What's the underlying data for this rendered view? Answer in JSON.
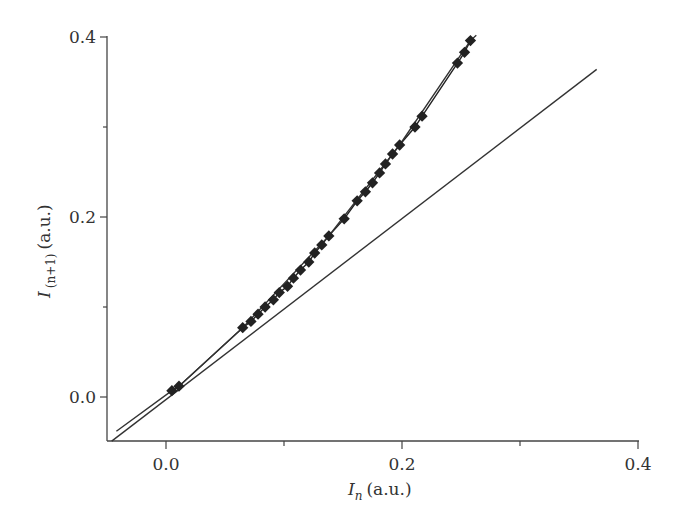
{
  "chart_data": {
    "type": "scatter",
    "title": "",
    "xlabel": "I_n (a.u.)",
    "ylabel": "I_(n+1) (a.u.)",
    "xlabel_parts": {
      "symbol": "I",
      "subscript": "n",
      "unit": "(a.u.)"
    },
    "ylabel_parts": {
      "symbol": "I",
      "subscript": "(n+1)",
      "unit": "(a.u.)"
    },
    "xlim": [
      -0.05,
      0.4
    ],
    "ylim": [
      -0.05,
      0.4
    ],
    "x_ticks": [
      0.0,
      0.1,
      0.2,
      0.3,
      0.4
    ],
    "x_tick_labels": [
      "0.0",
      "",
      "0.2",
      "",
      "0.4"
    ],
    "y_ticks": [
      0.0,
      0.1,
      0.2,
      0.3,
      0.4
    ],
    "y_tick_labels": [
      "0.0",
      "",
      "0.2",
      "",
      "0.4"
    ],
    "grid": false,
    "legend": null,
    "series": [
      {
        "name": "measured return map",
        "style": "markers-with-line",
        "marker": "filled-square",
        "color": "#222222",
        "x": [
          0.005,
          0.011,
          0.065,
          0.072,
          0.078,
          0.084,
          0.091,
          0.096,
          0.103,
          0.108,
          0.114,
          0.121,
          0.126,
          0.132,
          0.138,
          0.151,
          0.162,
          0.169,
          0.175,
          0.181,
          0.186,
          0.192,
          0.198,
          0.211,
          0.217,
          0.247,
          0.253,
          0.258
        ],
        "y": [
          0.007,
          0.012,
          0.077,
          0.084,
          0.092,
          0.1,
          0.108,
          0.116,
          0.123,
          0.132,
          0.141,
          0.15,
          0.16,
          0.169,
          0.179,
          0.198,
          0.218,
          0.228,
          0.238,
          0.249,
          0.259,
          0.27,
          0.28,
          0.3,
          0.312,
          0.371,
          0.383,
          0.396
        ]
      },
      {
        "name": "fit curve",
        "style": "line",
        "color": "#333333",
        "x": [
          -0.042,
          0.005,
          0.011,
          0.065,
          0.138,
          0.198,
          0.258,
          0.263
        ],
        "y": [
          -0.038,
          0.007,
          0.012,
          0.077,
          0.179,
          0.28,
          0.396,
          0.402
        ]
      },
      {
        "name": "identity line y = x",
        "style": "line",
        "color": "#333333",
        "x": [
          -0.046,
          0.365
        ],
        "y": [
          -0.049,
          0.364
        ]
      }
    ]
  }
}
